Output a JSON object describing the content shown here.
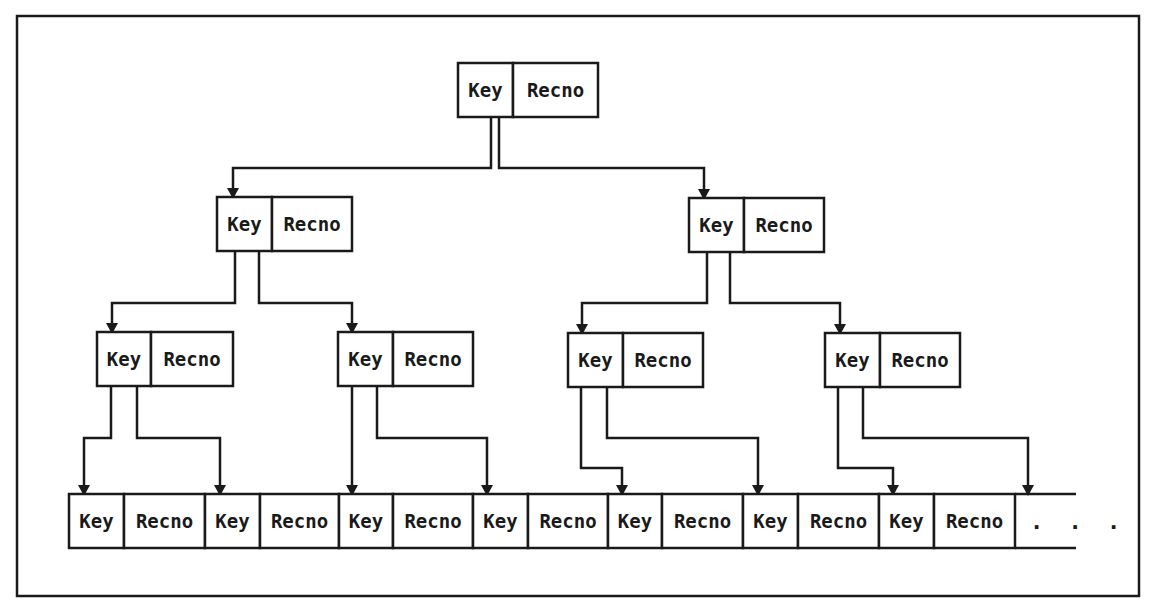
{
  "diagram": {
    "type": "binary-tree-index",
    "frame": {
      "x": 17,
      "y": 16,
      "w": 1122,
      "h": 580
    },
    "labels": {
      "key": "Key",
      "recno": "Recno",
      "continuation": ". . ."
    },
    "nodes": [
      {
        "id": "root",
        "level": 0,
        "x": 458,
        "y": 63,
        "key_w": 55,
        "recno_w": 85,
        "h": 54
      },
      {
        "id": "L1-a",
        "level": 1,
        "x": 217,
        "y": 197,
        "key_w": 55,
        "recno_w": 80,
        "h": 54
      },
      {
        "id": "L1-b",
        "level": 1,
        "x": 689,
        "y": 198,
        "key_w": 55,
        "recno_w": 80,
        "h": 54
      },
      {
        "id": "L2-a",
        "level": 2,
        "x": 97,
        "y": 332,
        "key_w": 54,
        "recno_w": 82,
        "h": 54
      },
      {
        "id": "L2-b",
        "level": 2,
        "x": 338,
        "y": 332,
        "key_w": 55,
        "recno_w": 80,
        "h": 54
      },
      {
        "id": "L2-c",
        "level": 2,
        "x": 568,
        "y": 333,
        "key_w": 55,
        "recno_w": 80,
        "h": 54
      },
      {
        "id": "L2-d",
        "level": 2,
        "x": 825,
        "y": 333,
        "key_w": 55,
        "recno_w": 80,
        "h": 54
      }
    ],
    "leaf_row": {
      "y": 494,
      "h": 54,
      "x_start": 69,
      "x_end": 1076,
      "cells": [
        {
          "label_ref": "key",
          "x": 69,
          "w": 55
        },
        {
          "label_ref": "recno",
          "x": 124,
          "w": 81
        },
        {
          "label_ref": "key",
          "x": 205,
          "w": 55
        },
        {
          "label_ref": "recno",
          "x": 260,
          "w": 79
        },
        {
          "label_ref": "key",
          "x": 339,
          "w": 54
        },
        {
          "label_ref": "recno",
          "x": 393,
          "w": 80
        },
        {
          "label_ref": "key",
          "x": 473,
          "w": 55
        },
        {
          "label_ref": "recno",
          "x": 528,
          "w": 80
        },
        {
          "label_ref": "key",
          "x": 608,
          "w": 54
        },
        {
          "label_ref": "recno",
          "x": 662,
          "w": 81
        },
        {
          "label_ref": "key",
          "x": 743,
          "w": 55
        },
        {
          "label_ref": "recno",
          "x": 798,
          "w": 81
        },
        {
          "label_ref": "key",
          "x": 879,
          "w": 55
        },
        {
          "label_ref": "recno",
          "x": 934,
          "w": 81
        }
      ],
      "continuation_x": 1030
    },
    "edges": [
      {
        "from": "root",
        "points": [
          [
            491,
            117
          ],
          [
            491,
            168
          ],
          [
            233,
            168
          ],
          [
            233,
            197
          ]
        ]
      },
      {
        "from": "root",
        "points": [
          [
            499,
            117
          ],
          [
            499,
            168
          ],
          [
            704,
            168
          ],
          [
            704,
            198
          ]
        ]
      },
      {
        "from": "L1-a",
        "points": [
          [
            235,
            251
          ],
          [
            235,
            303
          ],
          [
            112,
            303
          ],
          [
            112,
            332
          ]
        ]
      },
      {
        "from": "L1-a",
        "points": [
          [
            259,
            251
          ],
          [
            259,
            303
          ],
          [
            352,
            303
          ],
          [
            352,
            332
          ]
        ]
      },
      {
        "from": "L1-b",
        "points": [
          [
            707,
            252
          ],
          [
            707,
            303
          ],
          [
            582,
            303
          ],
          [
            582,
            333
          ]
        ]
      },
      {
        "from": "L1-b",
        "points": [
          [
            730,
            252
          ],
          [
            730,
            303
          ],
          [
            840,
            303
          ],
          [
            840,
            333
          ]
        ]
      },
      {
        "from": "L2-a",
        "points": [
          [
            111,
            386
          ],
          [
            111,
            438
          ],
          [
            84,
            438
          ],
          [
            84,
            494
          ]
        ]
      },
      {
        "from": "L2-a",
        "points": [
          [
            137,
            386
          ],
          [
            137,
            438
          ],
          [
            220,
            438
          ],
          [
            220,
            494
          ]
        ]
      },
      {
        "from": "L2-b",
        "points": [
          [
            352,
            386
          ],
          [
            352,
            494
          ]
        ]
      },
      {
        "from": "L2-b",
        "points": [
          [
            377,
            386
          ],
          [
            377,
            438
          ],
          [
            487,
            438
          ],
          [
            487,
            494
          ]
        ]
      },
      {
        "from": "L2-c",
        "points": [
          [
            581,
            387
          ],
          [
            581,
            468
          ],
          [
            622,
            468
          ],
          [
            622,
            494
          ]
        ]
      },
      {
        "from": "L2-c",
        "points": [
          [
            607,
            387
          ],
          [
            607,
            438
          ],
          [
            758,
            438
          ],
          [
            758,
            494
          ]
        ]
      },
      {
        "from": "L2-d",
        "points": [
          [
            838,
            387
          ],
          [
            838,
            468
          ],
          [
            893,
            468
          ],
          [
            893,
            494
          ]
        ]
      },
      {
        "from": "L2-d",
        "points": [
          [
            863,
            387
          ],
          [
            863,
            438
          ],
          [
            1028,
            438
          ],
          [
            1028,
            494
          ]
        ]
      }
    ]
  }
}
